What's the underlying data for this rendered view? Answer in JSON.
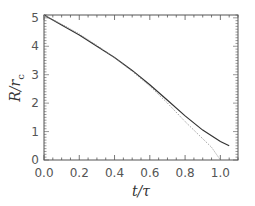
{
  "chart_data": {
    "type": "line",
    "title": "",
    "xlabel": "t/τ",
    "ylabel": "R/r_c",
    "xlim": [
      0.0,
      1.1
    ],
    "ylim": [
      0.0,
      5.1
    ],
    "x_ticks": [
      "0.0",
      "0.2",
      "0.4",
      "0.6",
      "0.8",
      "1.0"
    ],
    "y_ticks": [
      "0",
      "1",
      "2",
      "3",
      "4",
      "5"
    ],
    "grid": false,
    "legend": null,
    "series": [
      {
        "name": "solid",
        "style": "solid",
        "color": "#333333",
        "points": [
          [
            0.0,
            5.1
          ],
          [
            0.1,
            4.75
          ],
          [
            0.2,
            4.4
          ],
          [
            0.3,
            4.0
          ],
          [
            0.4,
            3.6
          ],
          [
            0.5,
            3.15
          ],
          [
            0.6,
            2.65
          ],
          [
            0.7,
            2.1
          ],
          [
            0.8,
            1.55
          ],
          [
            0.9,
            1.05
          ],
          [
            1.0,
            0.65
          ],
          [
            1.05,
            0.5
          ]
        ]
      },
      {
        "name": "dotted",
        "style": "dotted",
        "color": "#888888",
        "points": [
          [
            0.0,
            5.1
          ],
          [
            0.1,
            4.78
          ],
          [
            0.2,
            4.43
          ],
          [
            0.3,
            4.03
          ],
          [
            0.4,
            3.6
          ],
          [
            0.5,
            3.12
          ],
          [
            0.6,
            2.6
          ],
          [
            0.7,
            2.0
          ],
          [
            0.8,
            1.35
          ],
          [
            0.9,
            0.75
          ],
          [
            0.95,
            0.45
          ],
          [
            1.0,
            0.0
          ]
        ]
      }
    ]
  }
}
